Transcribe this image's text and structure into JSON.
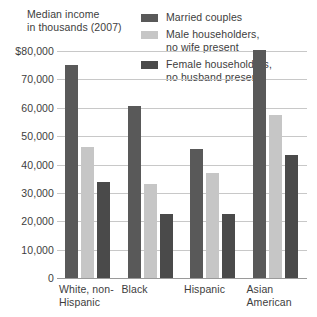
{
  "chart_data": {
    "type": "bar",
    "title": "Median income in thousands (2007)",
    "title_lines": [
      "Median income",
      "in thousands (2007)"
    ],
    "xlabel": "",
    "ylabel": "",
    "ylim": [
      0,
      80000
    ],
    "grid": true,
    "legend_position": "top-right",
    "categories": [
      "White, non-Hispanic",
      "Black",
      "Hispanic",
      "Asian American"
    ],
    "category_lines": [
      [
        "White, non-",
        "Hispanic"
      ],
      [
        "Black"
      ],
      [
        "Hispanic"
      ],
      [
        "Asian",
        "American"
      ]
    ],
    "ytick_labels": [
      "$80,000",
      "70,000",
      "60,000",
      "50,000",
      "40,000",
      "30,000",
      "20,000",
      "10,000",
      "0"
    ],
    "ytick_values": [
      80000,
      70000,
      60000,
      50000,
      40000,
      30000,
      20000,
      10000,
      0
    ],
    "series": [
      {
        "name": "Married couples",
        "color": "#595959",
        "values": [
          75000,
          60500,
          45500,
          80500
        ]
      },
      {
        "name": "Male householders, no wife present",
        "name_lines": [
          "Male householders,",
          "no wife present"
        ],
        "color": "#c6c6c6",
        "values": [
          46000,
          33000,
          37000,
          57500
        ]
      },
      {
        "name": "Female householders, no husband present",
        "name_lines": [
          "Female householders,",
          "no husband present"
        ],
        "color": "#4a4a4a",
        "values": [
          34000,
          22500,
          22500,
          43500
        ]
      }
    ]
  }
}
